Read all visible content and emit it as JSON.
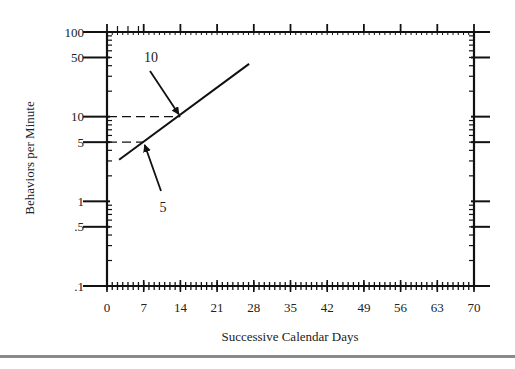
{
  "chart_data": {
    "type": "line",
    "title": "",
    "xlabel": "Successive Calendar Days",
    "ylabel": "Behaviors per Minute",
    "x_scale": "linear",
    "y_scale": "log",
    "xlim": [
      0,
      70
    ],
    "ylim": [
      0.1,
      100
    ],
    "x_ticks": [
      0,
      7,
      14,
      21,
      28,
      35,
      42,
      49,
      56,
      63,
      70
    ],
    "x_tick_labels": [
      "0",
      "7",
      "14",
      "21",
      "28",
      "35",
      "42",
      "49",
      "56",
      "63",
      "70"
    ],
    "y_ticks": [
      0.1,
      0.5,
      1,
      5,
      10,
      50,
      100
    ],
    "y_tick_labels": [
      ".1",
      ".5",
      "1",
      "5",
      "10",
      "50",
      "100"
    ],
    "grid": false,
    "legend": null,
    "series": [
      {
        "name": "trend line",
        "x": [
          2.3,
          27.1
        ],
        "y": [
          3.1,
          42
        ],
        "style": "solid"
      }
    ],
    "reference_lines": [
      {
        "type": "dashed",
        "from": {
          "x": 0,
          "y": 10
        },
        "to": {
          "x": 14,
          "y": 10
        }
      },
      {
        "type": "dashed",
        "from": {
          "x": 0,
          "y": 5
        },
        "to": {
          "x": 7,
          "y": 5
        }
      }
    ],
    "annotations": [
      {
        "text": "10",
        "points_to": {
          "x": 14,
          "y": 10
        }
      },
      {
        "text": "5",
        "points_to": {
          "x": 7,
          "y": 5
        }
      }
    ]
  },
  "colors": {
    "ink": "#111111",
    "background": "#ffffff",
    "rule": "#8a8a8a"
  }
}
